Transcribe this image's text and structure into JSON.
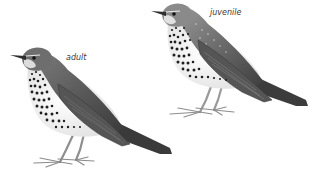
{
  "figure": {
    "background": "#ffffff",
    "birds": [
      {
        "id": "adult",
        "label": "adult",
        "label_pos": {
          "x": 66,
          "y": 54
        }
      },
      {
        "id": "juvenile",
        "label": "juvenile",
        "label_pos": {
          "x": 210,
          "y": 9
        }
      }
    ],
    "colors": {
      "back_dark": "#4a4a4a",
      "back_mid": "#6e6e6e",
      "wing": "#5a5a5a",
      "tail": "#3c3c3c",
      "breast": "#f2f2f2",
      "spots": "#1e1e1e",
      "legs": "#9a9a9a",
      "label": "#3a3a3a"
    }
  }
}
